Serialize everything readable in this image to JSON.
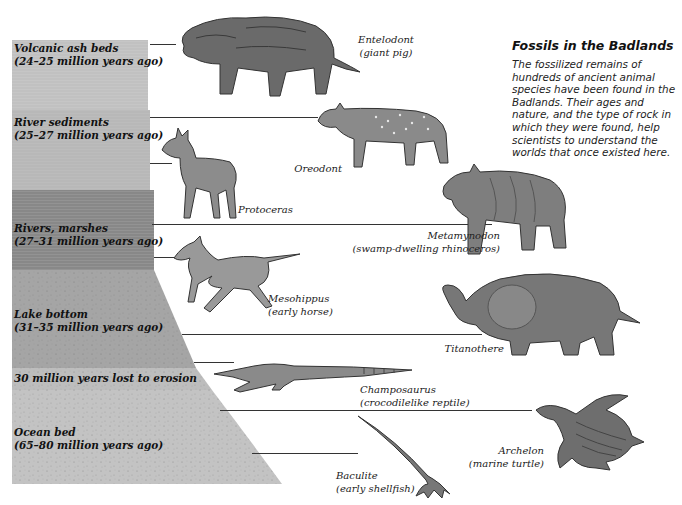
{
  "info": {
    "title": "Fossils in the Badlands",
    "body_lines": [
      "The fossilized remains of",
      "hundreds of ancient animal",
      "species have been found in the",
      "Badlands. Their ages and",
      "nature, and the type of rock in",
      "which they were found, help",
      "scientists to understand the",
      "worlds that once existed here."
    ]
  },
  "strata": [
    {
      "name": "Volcanic ash beds",
      "age": "(24–25 million years ago)",
      "color": "#c4c4c4"
    },
    {
      "name": "River sediments",
      "age": "(25–27 million years ago)",
      "color": "#bdbdbd"
    },
    {
      "name": "Rivers, marshes",
      "age": "(27–31 million years ago)",
      "color": "#8f8f8f"
    },
    {
      "name": "Lake bottom",
      "age": "(31–35 million years ago)",
      "color": "#a4a4a4"
    },
    {
      "name": "30 million years lost to erosion",
      "age": "",
      "color": "#bababa"
    },
    {
      "name": "Ocean bed",
      "age": "(65–80 million years ago)",
      "color": "#c2c2c2"
    }
  ],
  "animals": [
    {
      "name": "Entelodont",
      "desc": "(giant pig)"
    },
    {
      "name": "Oreodont",
      "desc": ""
    },
    {
      "name": "Protoceras",
      "desc": ""
    },
    {
      "name": "Metamynodon",
      "desc": "(swamp-dwelling rhinoceros)"
    },
    {
      "name": "Mesohippus",
      "desc": "(early horse)"
    },
    {
      "name": "Titanothere",
      "desc": ""
    },
    {
      "name": "Champosaurus",
      "desc": "(crocodilelike reptile)"
    },
    {
      "name": "Archelon",
      "desc": "(marine turtle)"
    },
    {
      "name": "Baculite",
      "desc": "(early shellfish)"
    }
  ],
  "colors": {
    "background": "#ffffff",
    "leader_line": "#333333",
    "animal_ink": "#555555"
  }
}
